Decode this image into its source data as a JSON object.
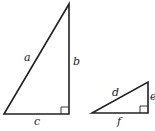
{
  "diagram": {
    "triangles": [
      {
        "name": "large-right-triangle",
        "labels": {
          "hypotenuse": "a",
          "vertical_leg": "b",
          "horizontal_leg": "c"
        }
      },
      {
        "name": "small-right-triangle",
        "labels": {
          "hypotenuse": "d",
          "vertical_leg": "e",
          "horizontal_leg": "f"
        }
      }
    ],
    "colors": {
      "stroke": "#222222",
      "background": "#ffffff"
    }
  }
}
